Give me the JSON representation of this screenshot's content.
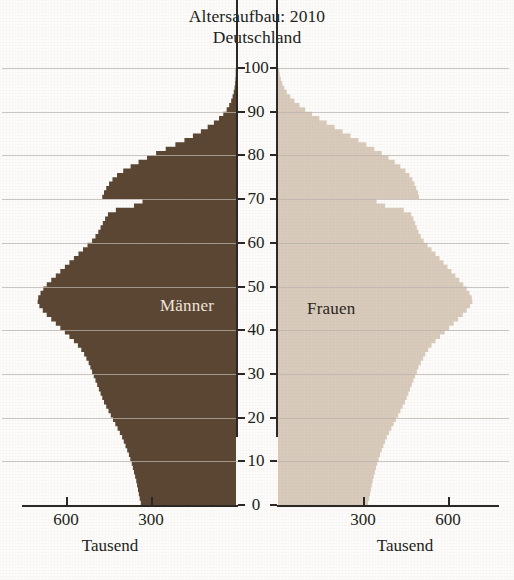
{
  "title": {
    "line1": "Altersaufbau: 2010",
    "line2": "Deutschland"
  },
  "axes": {
    "y_label_unit": "",
    "y_ticks": [
      0,
      10,
      20,
      30,
      40,
      50,
      60,
      70,
      80,
      90,
      100
    ],
    "x_ticks_left": [
      600,
      300
    ],
    "x_ticks_right": [
      300,
      600
    ],
    "unit_left": "Tausend",
    "unit_right": "Tausend"
  },
  "series_captions": {
    "male": "Männer",
    "female": "Frauen"
  },
  "colors": {
    "male_fill": "#5b4533",
    "female_fill": "#d9cbbc",
    "axis": "#2b2724",
    "gridline": "#b9b4ad",
    "background": "#fdfcfa",
    "male_caption_text": "#efe7de",
    "female_caption_text": "#2a2520"
  },
  "chart_data": {
    "type": "bar",
    "subtitle": "Population pyramid of Germany, 2010",
    "orientation": "horizontal-pyramid",
    "xlabel": "Tausend",
    "ylabel": "Alter (Jahre)",
    "xlim_left": [
      0,
      700
    ],
    "xlim_right": [
      0,
      700
    ],
    "ylim": [
      0,
      100
    ],
    "grid": true,
    "legend_position": "inside-panels",
    "categories": [
      0,
      1,
      2,
      3,
      4,
      5,
      6,
      7,
      8,
      9,
      10,
      11,
      12,
      13,
      14,
      15,
      16,
      17,
      18,
      19,
      20,
      21,
      22,
      23,
      24,
      25,
      26,
      27,
      28,
      29,
      30,
      31,
      32,
      33,
      34,
      35,
      36,
      37,
      38,
      39,
      40,
      41,
      42,
      43,
      44,
      45,
      46,
      47,
      48,
      49,
      50,
      51,
      52,
      53,
      54,
      55,
      56,
      57,
      58,
      59,
      60,
      61,
      62,
      63,
      64,
      65,
      66,
      67,
      68,
      69,
      70,
      71,
      72,
      73,
      74,
      75,
      76,
      77,
      78,
      79,
      80,
      81,
      82,
      83,
      84,
      85,
      86,
      87,
      88,
      89,
      90,
      91,
      92,
      93,
      94,
      95,
      96,
      97,
      98,
      99,
      100
    ],
    "series": [
      {
        "name": "Männer",
        "side": "left",
        "values": [
          336,
          340,
          343,
          346,
          349,
          352,
          356,
          360,
          364,
          368,
          373,
          378,
          384,
          390,
          396,
          402,
          410,
          418,
          426,
          434,
          442,
          450,
          458,
          466,
          472,
          478,
          484,
          490,
          496,
          502,
          508,
          514,
          520,
          528,
          536,
          546,
          558,
          572,
          588,
          604,
          620,
          636,
          652,
          668,
          682,
          694,
          700,
          698,
          690,
          680,
          668,
          652,
          636,
          620,
          604,
          588,
          572,
          556,
          540,
          524,
          508,
          496,
          486,
          478,
          470,
          462,
          452,
          424,
          360,
          330,
          472,
          466,
          458,
          448,
          436,
          420,
          398,
          372,
          344,
          314,
          282,
          248,
          214,
          182,
          152,
          124,
          100,
          78,
          60,
          45,
          33,
          24,
          17,
          12,
          8,
          5,
          3,
          2,
          1,
          1,
          0
        ]
      },
      {
        "name": "Frauen",
        "side": "right",
        "values": [
          318,
          322,
          325,
          328,
          331,
          334,
          338,
          342,
          346,
          350,
          355,
          360,
          366,
          372,
          378,
          384,
          392,
          400,
          408,
          416,
          424,
          432,
          440,
          448,
          454,
          460,
          466,
          472,
          478,
          484,
          490,
          496,
          504,
          512,
          520,
          530,
          542,
          556,
          572,
          588,
          604,
          620,
          636,
          652,
          666,
          678,
          686,
          684,
          676,
          666,
          654,
          640,
          626,
          612,
          598,
          584,
          570,
          556,
          542,
          528,
          514,
          504,
          496,
          490,
          484,
          478,
          470,
          444,
          378,
          348,
          498,
          494,
          488,
          482,
          474,
          464,
          450,
          432,
          412,
          390,
          366,
          340,
          312,
          284,
          256,
          228,
          200,
          172,
          146,
          120,
          96,
          76,
          58,
          43,
          31,
          22,
          15,
          10,
          6,
          4,
          2
        ]
      }
    ],
    "notes": [
      "Deep notch at ages 68-69 (birth deficit of 1941-1942, WWII)",
      "Baby-boom bulge peaks around ages 45-47",
      "Female side wider than male side above age 75 (higher female longevity)",
      "Narrow base below age 20 indicating low fertility"
    ]
  }
}
